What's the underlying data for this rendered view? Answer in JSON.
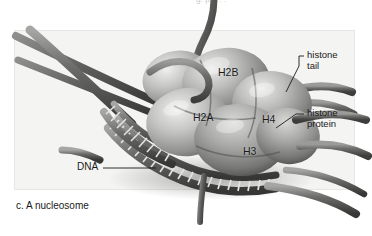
{
  "figure": {
    "caption": "c. A nucleosome",
    "top_cutoff_text": "g. p.    .  . .",
    "background_color": "#ffffff",
    "panel_color": "#f4f4f2",
    "ink_color": "#1a1a1a"
  },
  "core_labels": [
    {
      "id": "h2b",
      "text": "H2B",
      "x": 218,
      "y": 73
    },
    {
      "id": "h2a",
      "text": "H2A",
      "x": 193,
      "y": 118
    },
    {
      "id": "h4",
      "text": "H4",
      "x": 262,
      "y": 120
    },
    {
      "id": "h3",
      "text": "H3",
      "x": 243,
      "y": 152
    }
  ],
  "callouts": [
    {
      "id": "histone-tail",
      "line1": "histone",
      "line2": "tail",
      "x": 306,
      "y": 57
    },
    {
      "id": "histone-protein",
      "line1": "histone",
      "line2": "protein",
      "x": 306,
      "y": 114
    }
  ],
  "dna_label": {
    "text": "DNA",
    "x": 84,
    "y": 168
  },
  "structure": {
    "subunits": [
      "H2A",
      "H2B",
      "H3",
      "H4"
    ],
    "components": [
      "DNA",
      "histone protein",
      "histone tail"
    ],
    "dna_strands": 2,
    "description": "Nucleosome: DNA double helix wrapped around a histone octamer core with projecting histone tails"
  }
}
